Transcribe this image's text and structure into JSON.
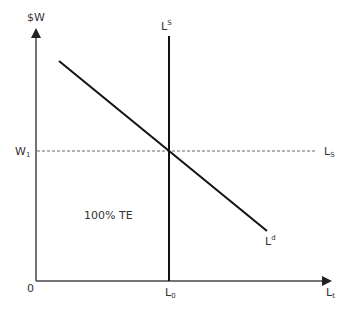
{
  "diagram": {
    "type": "labor-market-supply-demand",
    "y_axis_label": "$W",
    "x_axis_label_base": "L",
    "x_axis_label_sub": "t",
    "origin_label": "0",
    "wage_label_base": "W",
    "wage_label_sub": "1",
    "quantity_label_base": "L",
    "quantity_label_sub": "0",
    "vertical_supply_label_base": "L",
    "vertical_supply_label_sup": "S",
    "horizontal_supply_label_base": "L",
    "horizontal_supply_label_sub": "S",
    "demand_label_base": "L",
    "demand_label_sup": "d",
    "region_label": "100% TE",
    "colors": {
      "line": "#111111",
      "axis": "#444444",
      "dashed": "#555555",
      "text": "#333333"
    }
  }
}
